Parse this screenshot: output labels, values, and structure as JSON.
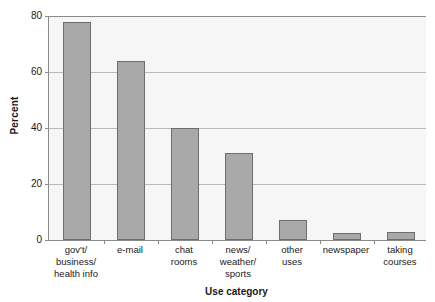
{
  "chart_data": {
    "type": "bar",
    "title": "",
    "xlabel": "Use category",
    "ylabel": "Percent",
    "categories": [
      "gov't/\nbusiness/\nhealth info",
      "e-mail",
      "chat\nrooms",
      "news/\nweather/\nsports",
      "other\nuses",
      "newspaper",
      "taking\ncourses"
    ],
    "category_lines": [
      [
        "gov't/",
        "business/",
        "health info"
      ],
      [
        "e-mail"
      ],
      [
        "chat",
        "rooms"
      ],
      [
        "news/",
        "weather/",
        "sports"
      ],
      [
        "other",
        "uses"
      ],
      [
        "newspaper"
      ],
      [
        "taking",
        "courses"
      ]
    ],
    "values": [
      78,
      64,
      40,
      31,
      7,
      2.5,
      3
    ],
    "ylim": [
      0,
      80
    ],
    "yticks": [
      0,
      20,
      40,
      60,
      80
    ],
    "ytick_labels": [
      "0",
      "20",
      "40",
      "60",
      "80"
    ],
    "grid": true,
    "grid_axis": "y",
    "legend": "none",
    "colors": {
      "bar_fill": "#a9a9a9",
      "bar_border": "#6e6e6e",
      "plot_background": "#f6f6f6",
      "gridline": "#b9b9b9",
      "axis": "#8a8a8a",
      "text": "#1a1a1a",
      "page_background": "#ffffff"
    }
  }
}
